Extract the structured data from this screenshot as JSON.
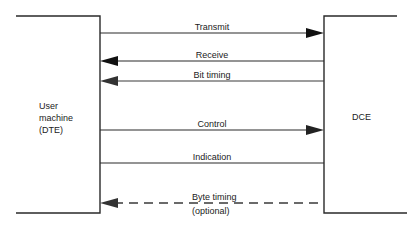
{
  "diagram": {
    "left_box": {
      "label_lines": [
        "User",
        "machine",
        "(DTE)"
      ]
    },
    "right_box": {
      "label": "DCE"
    },
    "signals": [
      {
        "label": "Transmit",
        "direction": "to-DCE",
        "style": "solid"
      },
      {
        "label": "Receive",
        "direction": "to-DTE",
        "style": "solid"
      },
      {
        "label": "Bit timing",
        "direction": "to-DTE",
        "style": "solid"
      },
      {
        "label": "Control",
        "direction": "to-DCE",
        "style": "solid"
      },
      {
        "label": "Indication",
        "direction": "none",
        "style": "solid"
      },
      {
        "label": "Byte timing",
        "sublabel": "(optional)",
        "direction": "to-DTE",
        "style": "dashed"
      }
    ],
    "colors": {
      "line": "#2a2a2a",
      "text": "#222222",
      "background": "#ffffff"
    }
  }
}
